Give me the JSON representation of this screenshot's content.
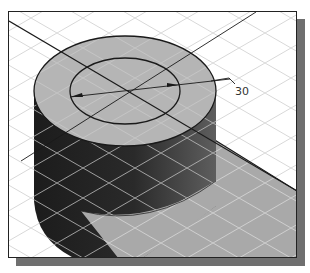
{
  "figure": {
    "type": "isometric-cad-view",
    "dimension": {
      "label": "30",
      "kind": "diameter"
    },
    "colors": {
      "background": "#ffffff",
      "frame_border": "#222222",
      "frame_shadow": "#6f6f6f",
      "top_face": "#b5b5b5",
      "side_dark": "#1f1f1f",
      "side_light": "#5a5a5a",
      "ground_shadow": "#a9a9a9",
      "grid_line": "#d6d6d6",
      "outline": "#1a1a1a"
    }
  }
}
